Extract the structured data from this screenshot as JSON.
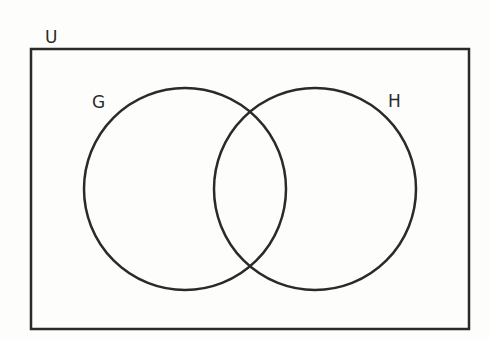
{
  "diagram": {
    "type": "venn",
    "universe_label": "U",
    "sets": [
      {
        "label": "G"
      },
      {
        "label": "H"
      }
    ],
    "stroke_color": "#2a2a2a",
    "background": "#fdfdfb"
  }
}
